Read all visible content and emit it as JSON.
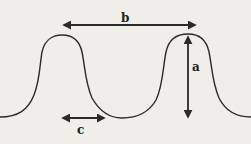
{
  "diagram": {
    "background_color": "#efeee8",
    "stroke_color": "#2a2a2a",
    "labels": {
      "a": "a",
      "b": "b",
      "c": "c"
    },
    "annotations": [
      {
        "label": "a",
        "meaning": "vertical arrow from crest to trough level (amplitude/height)"
      },
      {
        "label": "b",
        "meaning": "horizontal arrow spanning crest to crest (wavelength)"
      },
      {
        "label": "c",
        "meaning": "horizontal arrow spanning trough width"
      }
    ]
  }
}
